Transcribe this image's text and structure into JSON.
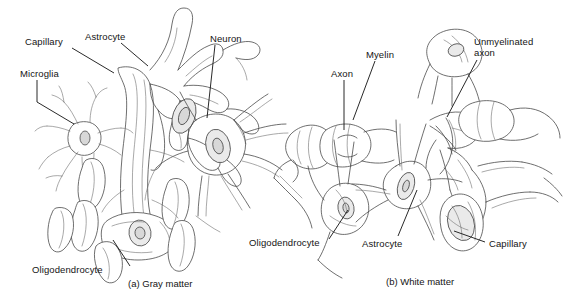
{
  "figure": {
    "background_color": "#ffffff",
    "ink_color": "#141414",
    "line_color": "#555555",
    "width": 567,
    "height": 302
  },
  "panels": [
    {
      "id": "a",
      "caption": "(a) Gray matter",
      "caption_pos": {
        "x": 128,
        "y": 278
      },
      "labels": [
        {
          "name": "capillary",
          "text": "Capillary",
          "x": 25,
          "y": 36,
          "leader": {
            "x1": 72,
            "y1": 48,
            "x2": 114,
            "y2": 73
          }
        },
        {
          "name": "astrocyte",
          "text": "Astrocyte",
          "x": 85,
          "y": 31,
          "leader": {
            "x1": 121,
            "y1": 43,
            "x2": 148,
            "y2": 66
          }
        },
        {
          "name": "neuron",
          "text": "Neuron",
          "x": 210,
          "y": 33,
          "leader": {
            "x1": 215,
            "y1": 45,
            "x2": 207,
            "y2": 118
          }
        },
        {
          "name": "microglia",
          "text": "Microglia",
          "x": 20,
          "y": 68,
          "leader": {
            "x1": 37,
            "y1": 80,
            "x2": 37,
            "y2": 102,
            "x3": 74,
            "y3": 124
          }
        },
        {
          "name": "oligodendrocyte",
          "text": "Oligodendrocyte",
          "x": 32,
          "y": 264,
          "leader": {
            "x1": 130,
            "y1": 266,
            "x2": 113,
            "y2": 240
          }
        }
      ]
    },
    {
      "id": "b",
      "caption": "(b) White matter",
      "caption_pos": {
        "x": 386,
        "y": 276
      },
      "labels": [
        {
          "name": "axon",
          "text": "Axon",
          "x": 331,
          "y": 68,
          "leader": {
            "x1": 344,
            "y1": 80,
            "x2": 344,
            "y2": 130
          }
        },
        {
          "name": "myelin",
          "text": "Myelin",
          "x": 366,
          "y": 49,
          "leader": {
            "x1": 375,
            "y1": 61,
            "x2": 353,
            "y2": 120
          }
        },
        {
          "name": "unmyelinated-axon",
          "text": "Unmyelinated axon",
          "x": 474,
          "y": 36,
          "leader": {
            "x1": 477,
            "y1": 60,
            "x2": 447,
            "y2": 117
          }
        },
        {
          "name": "oligodendrocyte",
          "text": "Oligodendrocyte",
          "x": 249,
          "y": 237,
          "leader": {
            "x1": 329,
            "y1": 239,
            "x2": 348,
            "y2": 210
          }
        },
        {
          "name": "astrocyte",
          "text": "Astrocyte",
          "x": 362,
          "y": 238,
          "leader": {
            "x1": 398,
            "y1": 236,
            "x2": 417,
            "y2": 190
          }
        },
        {
          "name": "capillary",
          "text": "Capillary",
          "x": 489,
          "y": 238,
          "leader": {
            "x1": 485,
            "y1": 242,
            "x2": 454,
            "y2": 231
          }
        }
      ]
    }
  ]
}
